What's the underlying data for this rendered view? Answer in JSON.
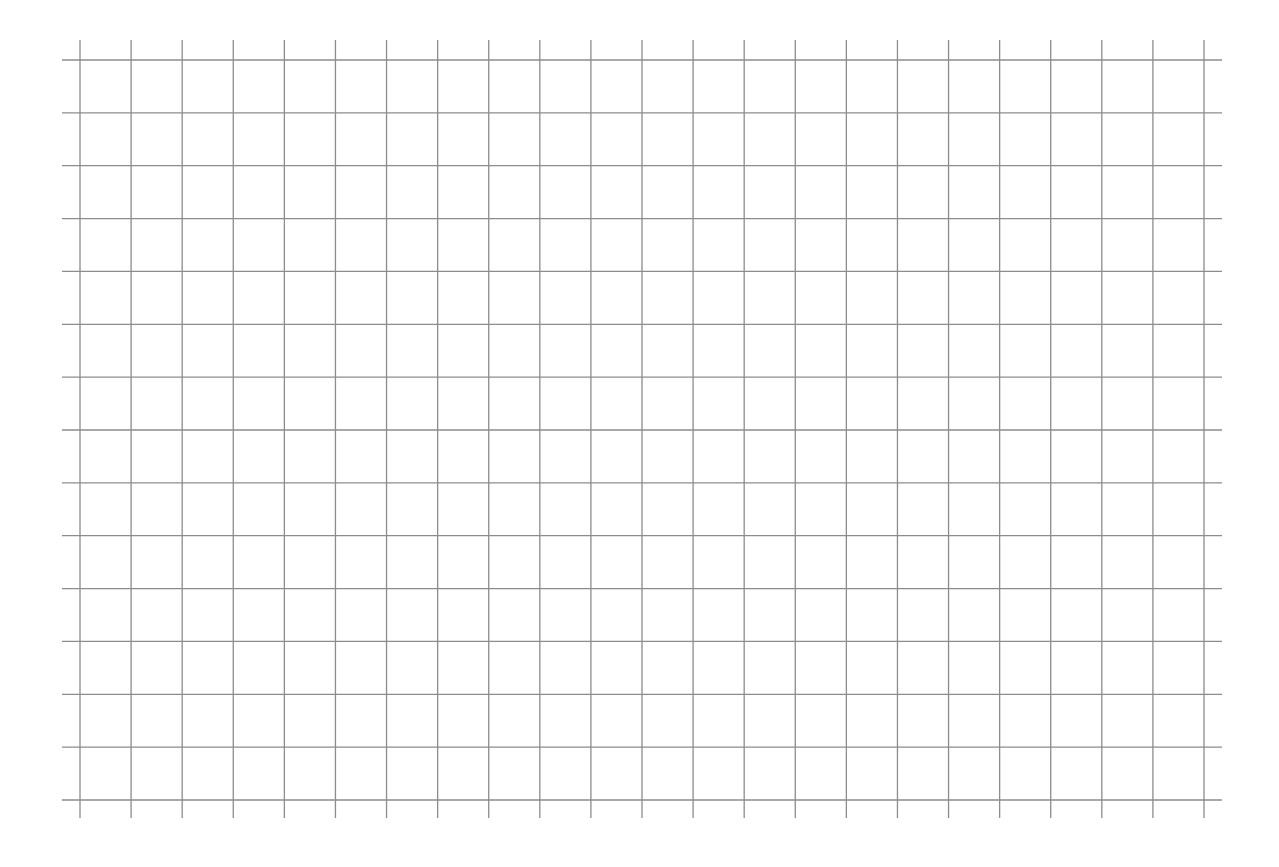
{
  "page": {
    "type": "graph-paper",
    "background_color": "#ffffff",
    "line_color": "#8c8c8c",
    "line_width": 1.3
  },
  "grid": {
    "vertical_lines": {
      "count": 23,
      "first_x": 80,
      "last_x": 1204,
      "y_start": 40,
      "y_end": 818
    },
    "horizontal_lines": {
      "count": 15,
      "first_y": 60,
      "last_y": 800,
      "x_start": 62,
      "x_end": 1222
    },
    "columns": 22,
    "rows": 14
  }
}
